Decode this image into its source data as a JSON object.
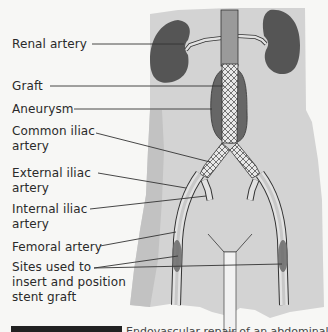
{
  "diagram": {
    "labels": [
      {
        "text": "Renal artery",
        "lines": [
          "Renal artery"
        ]
      },
      {
        "text": "Graft",
        "lines": [
          "Graft"
        ]
      },
      {
        "text": "Aneurysm",
        "lines": [
          "Aneurysm"
        ]
      },
      {
        "text": "Common iliac artery",
        "lines": [
          "Common iliac",
          "artery"
        ]
      },
      {
        "text": "External iliac artery",
        "lines": [
          "External iliac",
          "artery"
        ]
      },
      {
        "text": "Internal iliac artery",
        "lines": [
          "Internal iliac",
          "artery"
        ]
      },
      {
        "text": "Femoral artery",
        "lines": [
          "Femoral artery"
        ]
      },
      {
        "text": "Sites used to insert and position stent graft",
        "lines": [
          "Sites used to",
          "insert and position",
          "stent graft"
        ]
      }
    ],
    "colors": {
      "body": "#d6d6d6",
      "body_shade": "#c4c4c4",
      "organ": "#5a5a5a",
      "aneurysm": "#6b6b6b",
      "aorta": "#9a9a9a",
      "artery_fill": "#e2e2e2",
      "outline": "#333333",
      "leader": "#333333"
    }
  },
  "caption": {
    "text": "Endovascular repair of an abdominal aortic aneurysm"
  }
}
